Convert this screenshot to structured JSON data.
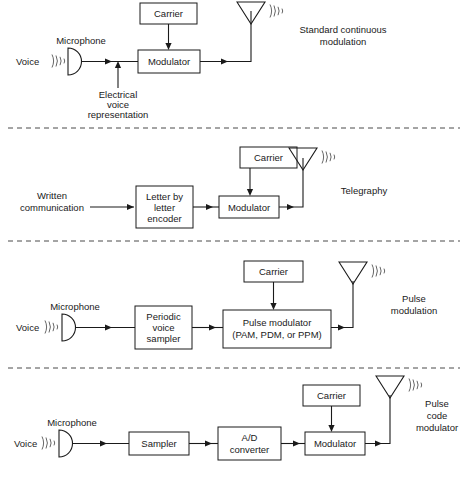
{
  "figure": {
    "ink_color": "#1a1a1a",
    "background": "#ffffff"
  },
  "panels": [
    {
      "id": "panel-standard-continuous",
      "source_label": "Voice",
      "transducer_label": "Microphone",
      "annotation": {
        "line1": "Electrical",
        "line2": "voice",
        "line3": "representation"
      },
      "carrier_label": "Carrier",
      "blocks": [
        {
          "id": "modulator",
          "line1": "Modulator"
        }
      ],
      "output": {
        "line1": "Standard continuous",
        "line2": "modulation"
      }
    },
    {
      "id": "panel-telegraphy",
      "source": {
        "line1": "Written",
        "line2": "communication"
      },
      "carrier_label": "Carrier",
      "blocks": [
        {
          "id": "encoder",
          "line1": "Letter by",
          "line2": "letter",
          "line3": "encoder"
        },
        {
          "id": "modulator",
          "line1": "Modulator"
        }
      ],
      "output": {
        "line1": "Telegraphy"
      }
    },
    {
      "id": "panel-pulse-modulation",
      "source_label": "Voice",
      "transducer_label": "Microphone",
      "carrier_label": "Carrier",
      "blocks": [
        {
          "id": "sampler",
          "line1": "Periodic",
          "line2": "voice",
          "line3": "sampler"
        },
        {
          "id": "pulse-modulator",
          "line1": "Pulse modulator",
          "line2": "(PAM, PDM, or PPM)"
        }
      ],
      "output": {
        "line1": "Pulse",
        "line2": "modulation"
      }
    },
    {
      "id": "panel-pulse-code-modulation",
      "source_label": "Voice",
      "transducer_label": "Microphone",
      "carrier_label": "Carrier",
      "blocks": [
        {
          "id": "sampler",
          "line1": "Sampler"
        },
        {
          "id": "ad-converter",
          "line1": "A/D",
          "line2": "converter"
        },
        {
          "id": "modulator",
          "line1": "Modulator"
        }
      ],
      "output": {
        "line1": "Pulse",
        "line2": "code",
        "line3": "modulator"
      }
    }
  ]
}
